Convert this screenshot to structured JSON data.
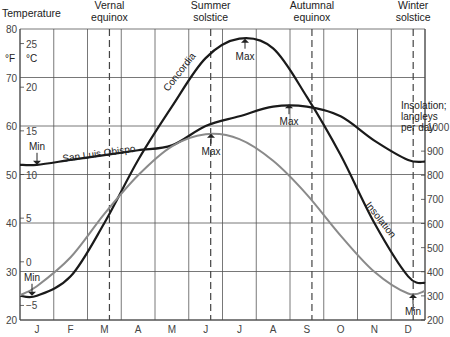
{
  "chart_data": {
    "type": "line",
    "title": "",
    "xlabel": "",
    "ylabel": "Temperature",
    "y_units": [
      "°F",
      "°C"
    ],
    "y2label": "Insolation; langleys per day:",
    "categories": [
      "J",
      "F",
      "M",
      "A",
      "M",
      "J",
      "J",
      "A",
      "S",
      "O",
      "N",
      "D"
    ],
    "ylim": [
      20,
      80
    ],
    "y2lim": [
      200,
      1000
    ],
    "grid": true,
    "y_ticks_f": [
      20,
      30,
      40,
      50,
      60,
      70,
      80
    ],
    "y_ticks_c": [
      25,
      20,
      15,
      10,
      5,
      0,
      -5
    ],
    "y2_ticks": [
      1000,
      900,
      800,
      700,
      600,
      500,
      400,
      300,
      200
    ],
    "events": [
      {
        "label_line1": "Vernal",
        "label_line2": "equinox",
        "month_pos": 2.65
      },
      {
        "label_line1": "Summer",
        "label_line2": "solstice",
        "month_pos": 5.65
      },
      {
        "label_line1": "Autumnal",
        "label_line2": "equinox",
        "month_pos": 8.65
      },
      {
        "label_line1": "Winter",
        "label_line2": "solstice",
        "month_pos": 11.65
      }
    ],
    "series": [
      {
        "name": "Concordia",
        "axis": "temperature_f",
        "color": "#1a1a1a",
        "values": [
          25,
          29,
          40,
          53,
          64,
          74,
          78,
          76,
          66,
          54,
          40,
          29
        ],
        "max": {
          "label": "Max",
          "value": 78
        },
        "min": {
          "label": "Min",
          "value": 25
        }
      },
      {
        "name": "San Luis Obispo",
        "axis": "temperature_f",
        "color": "#1a1a1a",
        "values": [
          52,
          53,
          54,
          55,
          56,
          60,
          62,
          64,
          64,
          62,
          57,
          53
        ],
        "max": {
          "label": "Max",
          "value": 64.5
        },
        "min": {
          "label": "Min",
          "value": 52
        }
      },
      {
        "name": "Insolation",
        "axis": "langleys",
        "color": "#8a8a8a",
        "values": [
          340,
          460,
          640,
          800,
          920,
          970,
          950,
          860,
          720,
          550,
          400,
          310
        ],
        "max": {
          "label": "Max",
          "value": 972
        },
        "min": {
          "label": "Min",
          "value": 308
        }
      }
    ]
  },
  "labels": {
    "temperature": "Temperature",
    "f_unit": "°F",
    "c_unit": "°C",
    "insolation_1": "Insolation;",
    "insolation_2": "langleys",
    "insolation_3": "per day:",
    "concordia": "Concordia",
    "slo": "San Luis Obispo",
    "insolation": "Insolation",
    "max": "Max",
    "min": "Min"
  }
}
